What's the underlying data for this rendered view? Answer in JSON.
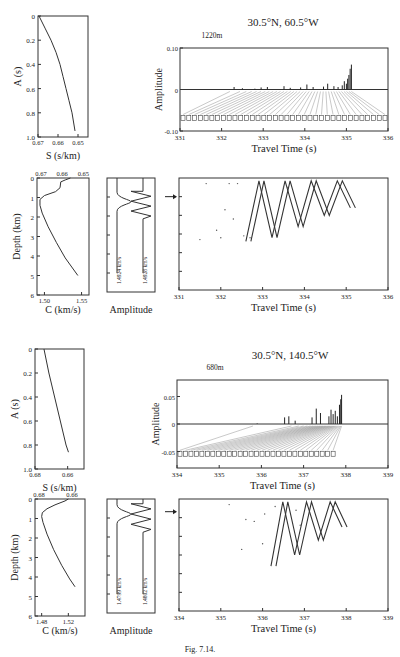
{
  "figure": {
    "caption": "Fig. 7.14.",
    "panels": [
      {
        "id": "top",
        "location_title": "30.5°N, 60.5°W",
        "source_depth": "1220m",
        "a_vs_s": {
          "ylabel": "A (s)",
          "xlabel": "S (s/km)",
          "y_ticks": [
            "0",
            "0.2",
            "0.4",
            "0.6",
            "0.8",
            "1.0"
          ],
          "x_ticks": [
            "0.67",
            "0.66",
            "0.65"
          ],
          "xlim": [
            0.67,
            0.645
          ],
          "ylim": [
            0,
            1.0
          ],
          "curve": [
            [
              0.6695,
              0
            ],
            [
              0.6665,
              0.1
            ],
            [
              0.6635,
              0.2
            ],
            [
              0.661,
              0.3
            ],
            [
              0.659,
              0.4
            ],
            [
              0.6575,
              0.5
            ],
            [
              0.656,
              0.6
            ],
            [
              0.6545,
              0.7
            ],
            [
              0.653,
              0.8
            ],
            [
              0.6515,
              0.95
            ]
          ]
        },
        "sound_speed": {
          "ylabel": "Depth (km)",
          "xlabel": "C (km/s)",
          "top_ticks": [
            "0.67",
            "0.66",
            "0.65"
          ],
          "y_ticks": [
            "0",
            "1",
            "2",
            "3",
            "4",
            "5",
            "6"
          ],
          "x_ticks": [
            "1.50",
            "1.55"
          ],
          "xlim": [
            1.49,
            1.56
          ],
          "ylim": [
            0,
            6
          ],
          "profile": [
            [
              1.535,
              0
            ],
            [
              1.528,
              0.1
            ],
            [
              1.522,
              0.2
            ],
            [
              1.521,
              0.5
            ],
            [
              1.515,
              0.7
            ],
            [
              1.5,
              0.9
            ],
            [
              1.494,
              1.1
            ],
            [
              1.494,
              1.4
            ],
            [
              1.497,
              1.8
            ],
            [
              1.505,
              2.5
            ],
            [
              1.516,
              3.3
            ],
            [
              1.528,
              4.1
            ],
            [
              1.545,
              5.0
            ]
          ]
        },
        "mode_shapes": {
          "xlabel": "Amplitude",
          "mode_labels": [
            "1.4924 km/s",
            "1.4928 km/s"
          ]
        },
        "arrivals": {
          "ylabel": "Amplitude",
          "xlabel": "Travel Time (s)",
          "x_ticks": [
            "331",
            "332",
            "333",
            "334",
            "335",
            "336"
          ],
          "y_ticks": [
            "0.10",
            "0",
            "-0.10"
          ],
          "xlim": [
            331,
            336
          ],
          "ylim": [
            -0.1,
            0.1
          ],
          "peaks": [
            [
              332.3,
              0.006
            ],
            [
              332.5,
              0.003
            ],
            [
              332.8,
              0.002
            ],
            [
              332.95,
              0.005
            ],
            [
              333.1,
              0.006
            ],
            [
              333.5,
              0.008
            ],
            [
              333.65,
              0.004
            ],
            [
              333.9,
              0.005
            ],
            [
              334.05,
              0.012
            ],
            [
              334.2,
              0.006
            ],
            [
              334.45,
              0.007
            ],
            [
              334.55,
              0.014
            ],
            [
              334.7,
              0.008
            ],
            [
              334.8,
              0.006
            ],
            [
              334.9,
              0.01
            ],
            [
              334.95,
              0.02
            ],
            [
              335.0,
              0.014
            ],
            [
              335.03,
              0.026
            ],
            [
              335.06,
              0.035
            ],
            [
              335.09,
              0.05
            ],
            [
              335.12,
              0.06
            ]
          ],
          "ray_label_count": 36
        },
        "ray_times": {
          "xlabel": "Travel Time (s)",
          "x_ticks": [
            "331",
            "332",
            "333",
            "334",
            "335",
            "336"
          ],
          "xlim": [
            331,
            336
          ],
          "source_marker_depth_km": 1.0
        }
      },
      {
        "id": "bottom",
        "location_title": "30.5°N, 140.5°W",
        "source_depth": "680m",
        "a_vs_s": {
          "ylabel": "A (s)",
          "xlabel": "S (s/km)",
          "y_ticks": [
            "0",
            "0.2",
            "0.4",
            "0.6",
            "0.8",
            "1.0"
          ],
          "x_ticks": [
            "0.68",
            "0.66"
          ],
          "xlim": [
            0.68,
            0.65
          ],
          "ylim": [
            0,
            1.0
          ],
          "curve": [
            [
              0.6745,
              0
            ],
            [
              0.6715,
              0.2
            ],
            [
              0.668,
              0.4
            ],
            [
              0.6645,
              0.6
            ],
            [
              0.661,
              0.8
            ],
            [
              0.6595,
              0.86
            ]
          ]
        },
        "sound_speed": {
          "ylabel": "Depth (km)",
          "xlabel": "C (km/s)",
          "top_ticks": [
            "0.68",
            "0.66"
          ],
          "y_ticks": [
            "0",
            "1",
            "2",
            "3",
            "4",
            "5",
            "6"
          ],
          "x_ticks": [
            "1.48",
            "1.52"
          ],
          "xlim": [
            1.47,
            1.545
          ],
          "ylim": [
            0,
            6
          ],
          "profile": [
            [
              1.52,
              0
            ],
            [
              1.515,
              0.1
            ],
            [
              1.5,
              0.3
            ],
            [
              1.488,
              0.5
            ],
            [
              1.481,
              0.7
            ],
            [
              1.48,
              0.9
            ],
            [
              1.482,
              1.2
            ],
            [
              1.488,
              1.8
            ],
            [
              1.498,
              2.6
            ],
            [
              1.51,
              3.4
            ],
            [
              1.522,
              4.1
            ],
            [
              1.53,
              4.5
            ]
          ]
        },
        "mode_shapes": {
          "xlabel": "Amplitude",
          "mode_labels": [
            "1.4799 km/s",
            "1.4802 km/s"
          ]
        },
        "arrivals": {
          "ylabel": "Amplitude",
          "xlabel": "Travel Time (s)",
          "x_ticks": [
            "334",
            "335",
            "336",
            "337",
            "338",
            "339"
          ],
          "y_ticks": [
            "0.05",
            "0",
            "-0.05"
          ],
          "xlim": [
            334,
            339
          ],
          "ylim": [
            -0.08,
            0.08
          ],
          "peaks": [
            [
              335.9,
              0.001
            ],
            [
              336.55,
              0.012
            ],
            [
              336.65,
              0.014
            ],
            [
              336.8,
              0.006
            ],
            [
              337.2,
              0.012
            ],
            [
              337.3,
              0.028
            ],
            [
              337.4,
              0.02
            ],
            [
              337.6,
              0.014
            ],
            [
              337.65,
              0.026
            ],
            [
              337.7,
              0.018
            ],
            [
              337.75,
              0.024
            ],
            [
              337.8,
              0.014
            ],
            [
              337.85,
              0.035
            ],
            [
              337.88,
              0.045
            ],
            [
              337.9,
              0.053
            ]
          ],
          "ray_label_count": 29
        },
        "ray_times": {
          "xlabel": "Travel Time (s)",
          "x_ticks": [
            "334",
            "335",
            "336",
            "337",
            "338",
            "339"
          ],
          "xlim": [
            334,
            339
          ],
          "source_marker_depth_km": 0.68
        }
      }
    ]
  },
  "chart_data": [
    {
      "type": "line",
      "title": "A vs S — 30.5°N, 60.5°W",
      "xlabel": "S (s/km)",
      "ylabel": "A (s)",
      "x": [
        0.6695,
        0.6665,
        0.6635,
        0.661,
        0.659,
        0.6575,
        0.656,
        0.6545,
        0.653,
        0.6515
      ],
      "y": [
        0,
        0.1,
        0.2,
        0.3,
        0.4,
        0.5,
        0.6,
        0.7,
        0.8,
        0.95
      ],
      "xlim": [
        0.67,
        0.645
      ],
      "ylim": [
        0,
        1.0
      ]
    },
    {
      "type": "bar",
      "title": "Arrival pattern — 30.5°N, 60.5°W, 1220m",
      "xlabel": "Travel Time (s)",
      "ylabel": "Amplitude",
      "xlim": [
        331,
        336
      ],
      "ylim": [
        -0.1,
        0.1
      ]
    },
    {
      "type": "line",
      "title": "Sound speed — 30.5°N, 60.5°W",
      "xlabel": "C (km/s)",
      "ylabel": "Depth (km)",
      "xlim": [
        1.49,
        1.56
      ],
      "ylim": [
        0,
        6
      ]
    },
    {
      "type": "scatter",
      "title": "Ray depth vs travel time — 30.5°N, 60.5°W",
      "xlabel": "Travel Time (s)",
      "xlim": [
        331,
        336
      ]
    },
    {
      "type": "line",
      "title": "A vs S — 30.5°N, 140.5°W",
      "xlabel": "S (s/km)",
      "ylabel": "A (s)",
      "x": [
        0.6745,
        0.6715,
        0.668,
        0.6645,
        0.661,
        0.6595
      ],
      "y": [
        0,
        0.2,
        0.4,
        0.6,
        0.8,
        0.86
      ],
      "xlim": [
        0.68,
        0.65
      ],
      "ylim": [
        0,
        1.0
      ]
    },
    {
      "type": "bar",
      "title": "Arrival pattern — 30.5°N, 140.5°W, 680m",
      "xlabel": "Travel Time (s)",
      "ylabel": "Amplitude",
      "xlim": [
        334,
        339
      ],
      "ylim": [
        -0.08,
        0.08
      ]
    },
    {
      "type": "line",
      "title": "Sound speed — 30.5°N, 140.5°W",
      "xlabel": "C (km/s)",
      "ylabel": "Depth (km)",
      "xlim": [
        1.47,
        1.545
      ],
      "ylim": [
        0,
        6
      ]
    },
    {
      "type": "scatter",
      "title": "Ray depth vs travel time — 30.5°N, 140.5°W",
      "xlabel": "Travel Time (s)",
      "xlim": [
        334,
        339
      ]
    }
  ]
}
